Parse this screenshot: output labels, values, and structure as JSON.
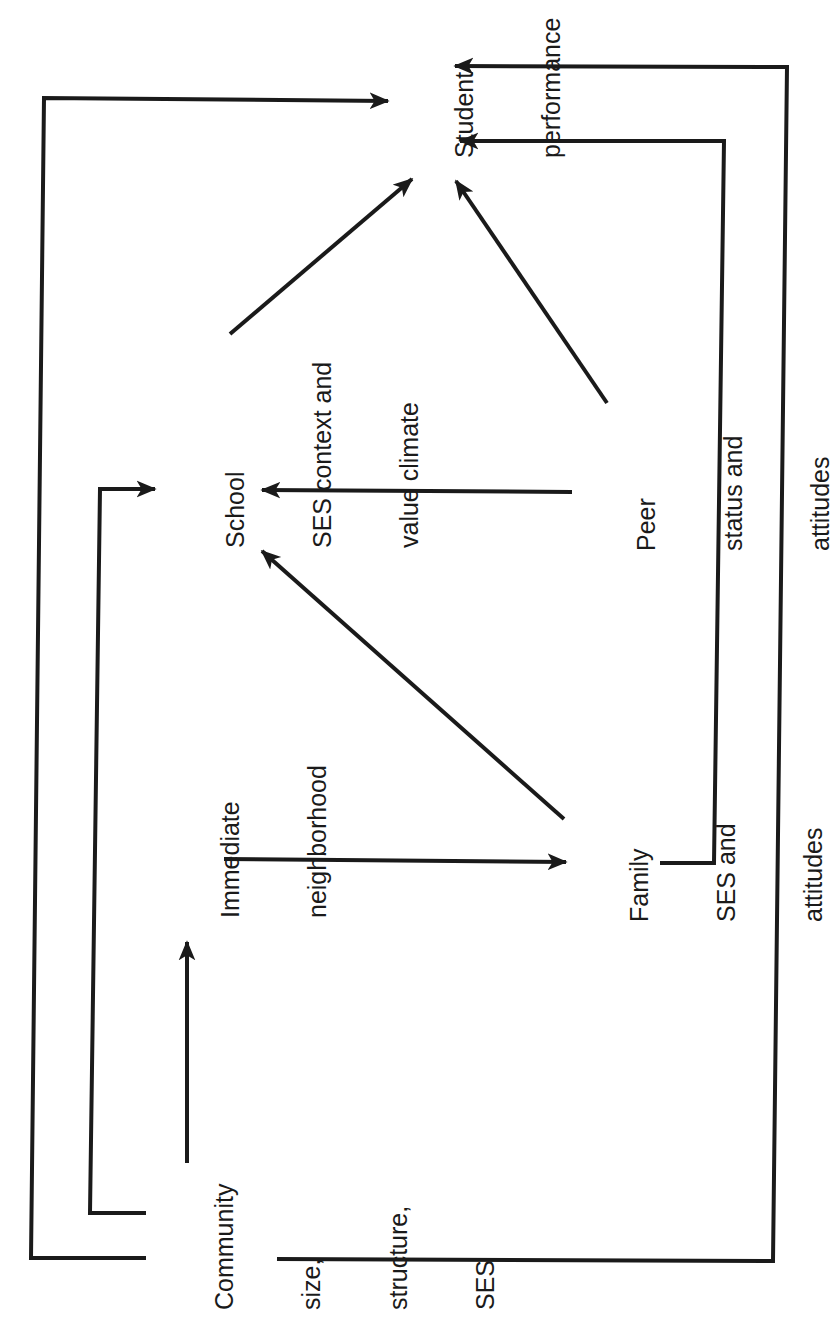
{
  "diagram": {
    "orientation": "rotated -90deg",
    "colors": {
      "line": "#1a1a1a",
      "text": "#1a1a1a",
      "background": "#ffffff"
    },
    "nodes": {
      "community": {
        "lines": [
          "Community",
          "size,",
          "structure,",
          "SES"
        ]
      },
      "neighborhood": {
        "lines": [
          "Immediate",
          "neighborhood"
        ]
      },
      "family": {
        "lines": [
          "Family",
          "SES and",
          "attitudes"
        ]
      },
      "school": {
        "lines": [
          "School",
          "SES context and",
          "value climate"
        ]
      },
      "peer": {
        "lines": [
          "Peer",
          "status and",
          "attitudes"
        ]
      },
      "student": {
        "lines": [
          "Student",
          "performance"
        ]
      }
    },
    "edges": [
      {
        "from": "Community",
        "to": "Immediate neighborhood"
      },
      {
        "from": "Community",
        "to": "School SES context and value climate"
      },
      {
        "from": "Community",
        "to": "Student performance"
      },
      {
        "from": "Community",
        "to": "Student performance (via right side)"
      },
      {
        "from": "Immediate neighborhood",
        "to": "Family SES and attitudes"
      },
      {
        "from": "Family SES and attitudes",
        "to": "School SES context and value climate"
      },
      {
        "from": "Family SES and attitudes",
        "to": "Student performance"
      },
      {
        "from": "Peer status and attitudes",
        "to": "School SES context and value climate"
      },
      {
        "from": "Peer status and attitudes",
        "to": "Student performance"
      },
      {
        "from": "School SES context and value climate",
        "to": "Student performance"
      }
    ]
  }
}
